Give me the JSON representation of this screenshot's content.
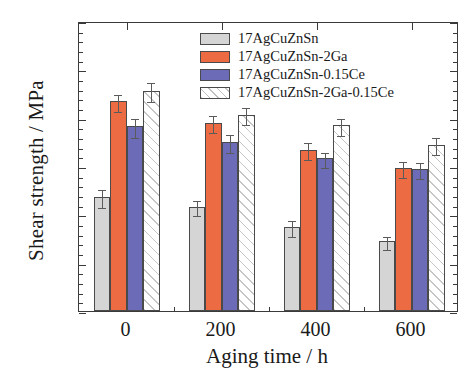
{
  "chart_data": {
    "type": "bar",
    "title": "",
    "xlabel": "Aging time / h",
    "ylabel": "Shear strength / MPa",
    "categories": [
      "0",
      "200",
      "400",
      "600"
    ],
    "xlim": [
      -0.5,
      3.5
    ],
    "ylim": [
      150,
      450
    ],
    "ytick_labels": [
      "150",
      "200",
      "250",
      "300",
      "350",
      "400",
      "450"
    ],
    "ytick_values": [
      150,
      200,
      250,
      300,
      350,
      400,
      450
    ],
    "ytick_minor_step": 10,
    "grid": false,
    "legend_position": "top-right inside",
    "series": [
      {
        "name": "17AgCuZnSn",
        "color": "#d5d5d5",
        "values": [
          268,
          258,
          237,
          222
        ],
        "errors": [
          9,
          8,
          8,
          7
        ]
      },
      {
        "name": "17AgCuZnSn-2Ga",
        "color": "#ec6b42",
        "values": [
          367,
          345,
          317,
          298
        ],
        "errors": [
          9,
          9,
          9,
          8
        ]
      },
      {
        "name": "17AgCuZnSn-0.15Ce",
        "color": "#6b6bb8",
        "values": [
          341,
          325,
          308,
          297
        ],
        "errors": [
          10,
          9,
          8,
          8
        ]
      },
      {
        "name": "17AgCuZnSn-2Ga-0.15Ce",
        "color": "#ffffff",
        "fill": "hatched",
        "values": [
          378,
          353,
          342,
          322
        ],
        "errors": [
          10,
          9,
          9,
          9
        ]
      }
    ]
  },
  "legend": {
    "items": [
      {
        "label": "17AgCuZnSn"
      },
      {
        "label": "17AgCuZnSn-2Ga"
      },
      {
        "label": "17AgCuZnSn-0.15Ce"
      },
      {
        "label": "17AgCuZnSn-2Ga-0.15Ce"
      }
    ]
  },
  "axes": {
    "y_title": "Shear strength / MPa",
    "x_title": "Aging time / h"
  }
}
